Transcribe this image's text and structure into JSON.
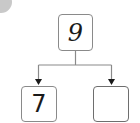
{
  "diagram": {
    "type": "number-bond",
    "badge": {
      "shape": "circle",
      "color": "#c9c9c9"
    },
    "whole": {
      "value": "9"
    },
    "parts": [
      {
        "value": "7"
      },
      {
        "value": ""
      }
    ],
    "colors": {
      "line": "#8a8a8a",
      "text": "#1a1a1a",
      "box_border": "#8a8a8a"
    }
  }
}
